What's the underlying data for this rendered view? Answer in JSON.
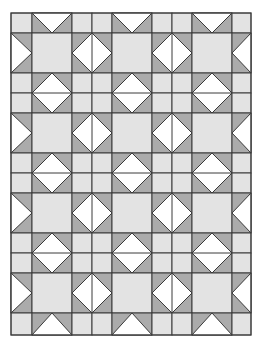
{
  "image": {
    "width": 256,
    "height": 338,
    "background": "#ffffff"
  },
  "quilt": {
    "origin": {
      "x": 11,
      "y": 13
    },
    "size": {
      "width": 240,
      "height": 322
    },
    "colors": {
      "light": "#e3e3e3",
      "dark": "#ababab",
      "white": "#ffffff",
      "line": "#3a3a3a"
    },
    "line_width": 1,
    "column_edges": [
      11,
      32,
      72,
      92,
      112,
      152,
      172,
      192,
      232,
      251
    ],
    "row_edges": [
      13,
      33,
      73,
      93,
      113,
      153,
      173,
      193,
      233,
      253,
      273,
      313,
      335
    ],
    "column_bands": [
      {
        "x0": 11,
        "x1": 32,
        "kind": "edge-left"
      },
      {
        "x0": 32,
        "x1": 72,
        "kind": "wide"
      },
      {
        "x0": 72,
        "x1": 112,
        "kind": "narrow-pair"
      },
      {
        "x0": 112,
        "x1": 152,
        "kind": "wide"
      },
      {
        "x0": 152,
        "x1": 192,
        "kind": "narrow-pair"
      },
      {
        "x0": 192,
        "x1": 232,
        "kind": "wide"
      },
      {
        "x0": 232,
        "x1": 251,
        "kind": "edge-right"
      }
    ],
    "row_bands": [
      {
        "y0": 13,
        "y1": 33,
        "kind": "edge-top"
      },
      {
        "y0": 33,
        "y1": 73,
        "kind": "wide"
      },
      {
        "y0": 73,
        "y1": 113,
        "kind": "narrow-pair"
      },
      {
        "y0": 113,
        "y1": 153,
        "kind": "wide"
      },
      {
        "y0": 153,
        "y1": 193,
        "kind": "narrow-pair"
      },
      {
        "y0": 193,
        "y1": 233,
        "kind": "wide"
      },
      {
        "y0": 233,
        "y1": 273,
        "kind": "narrow-pair"
      },
      {
        "y0": 273,
        "y1": 313,
        "kind": "wide"
      },
      {
        "y0": 313,
        "y1": 335,
        "kind": "edge-bottom"
      }
    ],
    "rules": {
      "wide_x_wide": "light-square",
      "narrow_x_narrow": "four-light-squares",
      "wide_row_narrow_col": "diamond-vertical-split",
      "narrow_row_wide_col": "diamond-horizontal-split",
      "edge_top_wide_col": "half-diamond-down",
      "edge_bottom_wide_col": "half-diamond-up",
      "edge_left_wide_row": "half-diamond-right",
      "edge_right_wide_row": "half-diamond-left",
      "edge_top_narrow_col": "two-light-squares-h",
      "edge_bottom_narrow_col": "two-light-squares-h",
      "edge_left_narrow_row": "two-light-squares-v",
      "edge_right_narrow_row": "two-light-squares-v",
      "corner": "light-square"
    }
  }
}
